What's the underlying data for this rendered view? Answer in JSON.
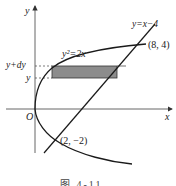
{
  "figure": {
    "caption": "图 4-11",
    "axes": {
      "x_label": "x",
      "y_label": "y",
      "origin_label": "O"
    },
    "curves": [
      {
        "name": "parabola",
        "equation": "y²=2x",
        "label": "y²=2x"
      },
      {
        "name": "line",
        "equation": "y=x−4",
        "label": "y=x−4"
      }
    ],
    "points": [
      {
        "label": "(8, 4)",
        "x": 8,
        "y": 4
      },
      {
        "label": "(2, −2)",
        "x": 2,
        "y": -2
      }
    ],
    "strip": {
      "lower_label": "y",
      "upper_label": "y+dy",
      "fill_color": "#8c8c8c"
    },
    "colors": {
      "stroke": "#1a1a1a",
      "axis": "#333333",
      "shade": "#8c8c8c"
    }
  }
}
